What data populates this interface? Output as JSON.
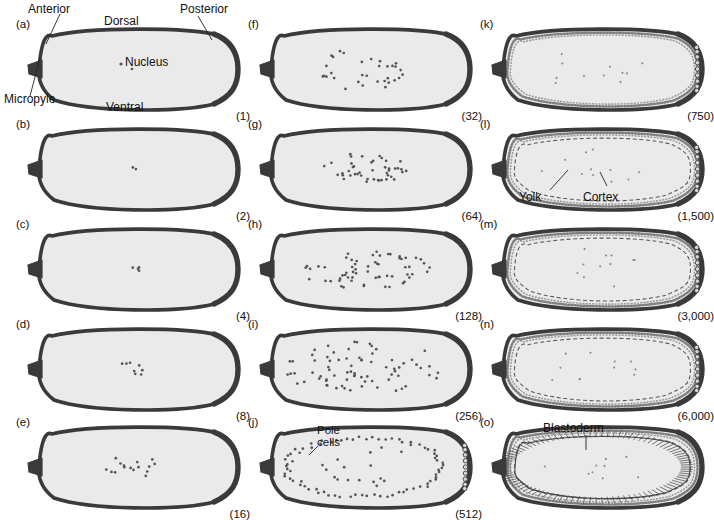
{
  "figure": {
    "colors": {
      "outline": "#3a3a3a",
      "cytoplasm": "#eaeaea",
      "yolk": "#efefef",
      "nucleus": "#555555",
      "micropyle": "#3a3a3a",
      "background": "#ffffff"
    }
  },
  "annotations": {
    "anterior": "Anterior",
    "dorsal": "Dorsal",
    "posterior": "Posterior",
    "ventral": "Ventral",
    "micropyle": "Micropyle",
    "nucleus": "Nucleus",
    "pole_cells_line1": "Pole",
    "pole_cells_line2": "cells",
    "yolk": "Yolk",
    "cortex": "Cortex",
    "blastoderm": "Blastoderm"
  },
  "chart_data": {
    "type": "diagram",
    "series_label": "Nuclei per embryo",
    "categories": [
      "a",
      "b",
      "c",
      "d",
      "e",
      "f",
      "g",
      "h",
      "i",
      "j",
      "k",
      "l",
      "m",
      "n",
      "o"
    ],
    "values": [
      1,
      2,
      4,
      8,
      16,
      32,
      64,
      128,
      256,
      512,
      750,
      1500,
      3000,
      6000,
      null
    ],
    "value_labels": [
      "(1)",
      "(2)",
      "(4)",
      "(8)",
      "(16)",
      "(32)",
      "(64)",
      "(128)",
      "(256)",
      "(512)",
      "(750)",
      "(1,500)",
      "(3,000)",
      "(6,000)",
      ""
    ]
  },
  "panels": [
    {
      "id": "a",
      "label": "(a)",
      "count": "(1)",
      "nuclei": 1,
      "stage": "central",
      "col": 0,
      "row": 0,
      "has_cortex": false,
      "has_yolk_ring": false,
      "has_pole_cells": false,
      "has_blastoderm": false
    },
    {
      "id": "b",
      "label": "(b)",
      "count": "(2)",
      "nuclei": 2,
      "stage": "central",
      "col": 0,
      "row": 1,
      "has_cortex": false,
      "has_yolk_ring": false,
      "has_pole_cells": false,
      "has_blastoderm": false
    },
    {
      "id": "c",
      "label": "(c)",
      "count": "(4)",
      "nuclei": 4,
      "stage": "central",
      "col": 0,
      "row": 2,
      "has_cortex": false,
      "has_yolk_ring": false,
      "has_pole_cells": false,
      "has_blastoderm": false
    },
    {
      "id": "d",
      "label": "(d)",
      "count": "(8)",
      "nuclei": 8,
      "stage": "central",
      "col": 0,
      "row": 3,
      "has_cortex": false,
      "has_yolk_ring": false,
      "has_pole_cells": false,
      "has_blastoderm": false
    },
    {
      "id": "e",
      "label": "(e)",
      "count": "(16)",
      "nuclei": 16,
      "stage": "central",
      "col": 0,
      "row": 4,
      "has_cortex": false,
      "has_yolk_ring": false,
      "has_pole_cells": false,
      "has_blastoderm": false
    },
    {
      "id": "f",
      "label": "(f)",
      "count": "(32)",
      "nuclei": 32,
      "stage": "central",
      "col": 1,
      "row": 0,
      "has_cortex": false,
      "has_yolk_ring": false,
      "has_pole_cells": false,
      "has_blastoderm": false
    },
    {
      "id": "g",
      "label": "(g)",
      "count": "(64)",
      "nuclei": 64,
      "stage": "spreading",
      "col": 1,
      "row": 1,
      "has_cortex": false,
      "has_yolk_ring": false,
      "has_pole_cells": false,
      "has_blastoderm": false
    },
    {
      "id": "h",
      "label": "(h)",
      "count": "(128)",
      "nuclei": 128,
      "stage": "spreading",
      "col": 1,
      "row": 2,
      "has_cortex": false,
      "has_yolk_ring": false,
      "has_pole_cells": false,
      "has_blastoderm": false
    },
    {
      "id": "i",
      "label": "(i)",
      "count": "(256)",
      "nuclei": 256,
      "stage": "spreading",
      "col": 1,
      "row": 3,
      "has_cortex": false,
      "has_yolk_ring": false,
      "has_pole_cells": false,
      "has_blastoderm": false
    },
    {
      "id": "j",
      "label": "(j)",
      "count": "(512)",
      "nuclei": 512,
      "stage": "peripheral",
      "col": 1,
      "row": 4,
      "has_cortex": false,
      "has_yolk_ring": false,
      "has_pole_cells": true,
      "has_blastoderm": false
    },
    {
      "id": "k",
      "label": "(k)",
      "count": "(750)",
      "nuclei": 750,
      "stage": "cortical",
      "col": 2,
      "row": 0,
      "has_cortex": true,
      "has_yolk_ring": false,
      "has_pole_cells": true,
      "has_blastoderm": false
    },
    {
      "id": "l",
      "label": "(l)",
      "count": "(1,500)",
      "nuclei": 1500,
      "stage": "cortical",
      "col": 2,
      "row": 1,
      "has_cortex": true,
      "has_yolk_ring": true,
      "has_pole_cells": true,
      "has_blastoderm": false
    },
    {
      "id": "m",
      "label": "(m)",
      "count": "(3,000)",
      "nuclei": 3000,
      "stage": "cortical",
      "col": 2,
      "row": 2,
      "has_cortex": true,
      "has_yolk_ring": true,
      "has_pole_cells": true,
      "has_blastoderm": false
    },
    {
      "id": "n",
      "label": "(n)",
      "count": "(6,000)",
      "nuclei": 6000,
      "stage": "cortical",
      "col": 2,
      "row": 3,
      "has_cortex": true,
      "has_yolk_ring": true,
      "has_pole_cells": true,
      "has_blastoderm": false
    },
    {
      "id": "o",
      "label": "(o)",
      "count": "",
      "nuclei": null,
      "stage": "blastoderm",
      "col": 2,
      "row": 4,
      "has_cortex": true,
      "has_yolk_ring": true,
      "has_pole_cells": false,
      "has_blastoderm": true
    }
  ]
}
